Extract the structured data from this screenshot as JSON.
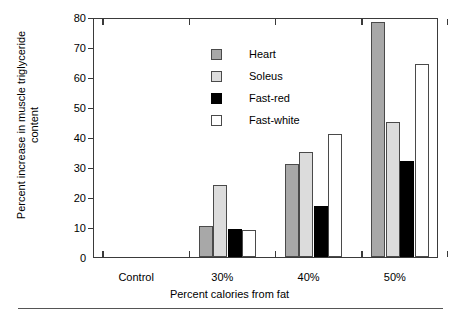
{
  "chart_data": {
    "type": "bar",
    "title": "",
    "subtitle": "",
    "xlabel": "Percent calories from fat",
    "ylabel": "Percent increase in muscle triglyceride content",
    "categories": [
      "Control",
      "30%",
      "40%",
      "50%"
    ],
    "series": [
      {
        "name": "Heart",
        "color": "#a8a8a8",
        "values": [
          0,
          10.5,
          31,
          78.5
        ]
      },
      {
        "name": "Soleus",
        "color": "#dcdcdc",
        "values": [
          0,
          24,
          35,
          45
        ]
      },
      {
        "name": "Fast-red",
        "color": "#000000",
        "values": [
          0,
          9.5,
          17,
          32
        ]
      },
      {
        "name": "Fast-white",
        "color": "#ffffff",
        "values": [
          0,
          9,
          41,
          64.5
        ]
      }
    ],
    "ylim": [
      0,
      80
    ],
    "yticks": [
      0,
      10,
      20,
      30,
      40,
      50,
      60,
      70,
      80
    ],
    "ytick_labels": [
      "0",
      "10",
      "20",
      "30",
      "40",
      "50",
      "60",
      "70",
      "80"
    ],
    "grid": false,
    "legend_position": "top-left",
    "legend": [
      "Heart",
      "Soleus",
      "Fast-red",
      "Fast-white"
    ]
  },
  "axis": {
    "y_title": "Percent increase in muscle triglyceride content",
    "x_title": "Percent calories from fat"
  }
}
